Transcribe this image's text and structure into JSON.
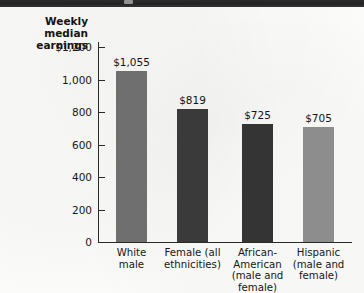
{
  "figure": {
    "background_color": "#fbfbfa",
    "top_band_color": "#2c2c2c",
    "axis_color": "#2a2a2a",
    "axis_title_line1": "Weekly",
    "axis_title_line2": "median",
    "axis_title_line3": "earnings"
  },
  "chart_data": {
    "type": "bar",
    "title": "",
    "xlabel": "",
    "ylabel": "Weekly median earnings",
    "ylim": [
      0,
      1200
    ],
    "grid": false,
    "legend": "none",
    "ytick_labels": [
      "$1,200",
      "1,000",
      "800",
      "600",
      "400",
      "200",
      "0"
    ],
    "ytick_values": [
      1200,
      1000,
      800,
      600,
      400,
      200,
      0
    ],
    "categories": [
      "White male",
      "Female (all ethnicities)",
      "African-American (male and female)",
      "Hispanic (male and female)"
    ],
    "category_lines": [
      [
        "White",
        "male"
      ],
      [
        "Female (all",
        "ethnicities)"
      ],
      [
        "African-",
        "American",
        "(male and",
        "female)"
      ],
      [
        "Hispanic",
        "(male and",
        "female)"
      ]
    ],
    "values": [
      1055,
      819,
      725,
      705
    ],
    "data_labels": [
      "$1,055",
      "$819",
      "$725",
      "$705"
    ],
    "bar_colors": [
      "#6f6f6f",
      "#3a3a3a",
      "#343434",
      "#8d8d8d"
    ]
  }
}
